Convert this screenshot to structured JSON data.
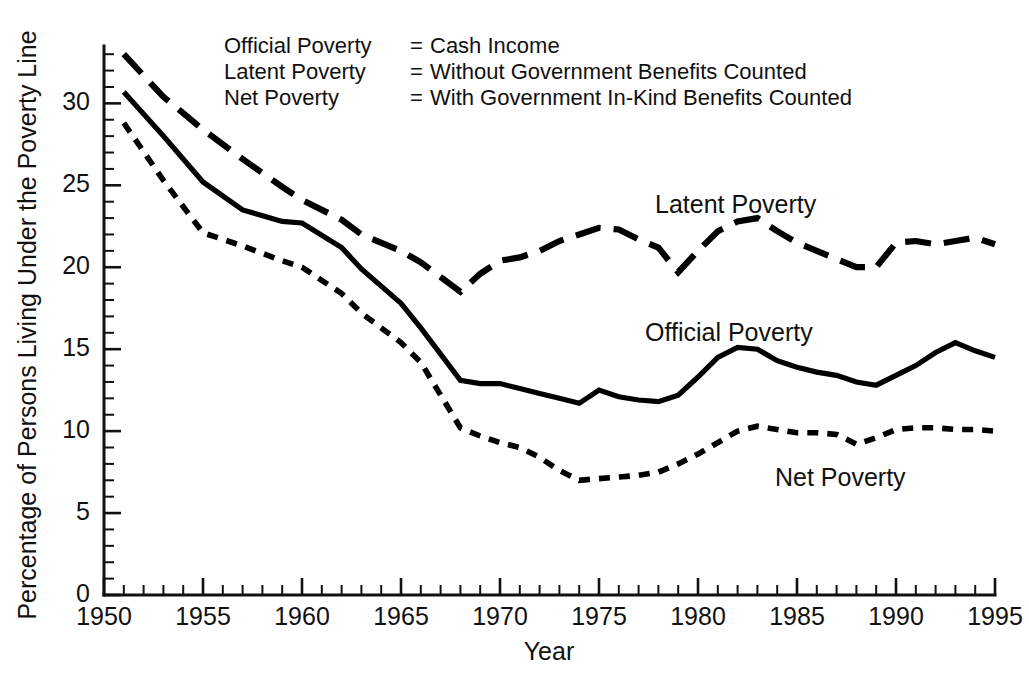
{
  "figure": {
    "background_color": "#ffffff",
    "ink_color": "#000000"
  },
  "legend_block": {
    "rows": [
      {
        "name": "Official Poverty",
        "equals": "=",
        "definition": "Cash Income"
      },
      {
        "name": "Latent Poverty",
        "equals": "=",
        "definition": "Without Government Benefits Counted"
      },
      {
        "name": "Net Poverty",
        "equals": "=",
        "definition": "With Government In-Kind Benefits Counted"
      }
    ]
  },
  "series_labels": [
    {
      "text": "Latent Poverty"
    },
    {
      "text": "Official Poverty"
    },
    {
      "text": "Net Poverty"
    }
  ],
  "axes": {
    "x": {
      "title": "Year",
      "ticks": [
        "1950",
        "1955",
        "1960",
        "1965",
        "1970",
        "1975",
        "1980",
        "1985",
        "1990",
        "1995"
      ],
      "minor_tick_step": 1,
      "range": [
        1950,
        1995
      ]
    },
    "y": {
      "title": "Percentage of Persons Living Under the Poverty Line",
      "ticks": [
        "0",
        "5",
        "10",
        "15",
        "20",
        "25",
        "30"
      ],
      "minor_tick_step": 1,
      "range": [
        0,
        33.5
      ]
    }
  },
  "chart_data": {
    "type": "line",
    "title": "",
    "subtitle": "",
    "xlabel": "Year",
    "ylabel": "Percentage of Persons Living Under the Poverty Line",
    "xlim": [
      1950,
      1995
    ],
    "ylim": [
      0,
      33.5
    ],
    "grid": false,
    "legend_position": "inline-annotations",
    "x": [
      1951,
      1953,
      1955,
      1957,
      1959,
      1960,
      1962,
      1963,
      1965,
      1966,
      1968,
      1969,
      1970,
      1971,
      1972,
      1973,
      1974,
      1975,
      1976,
      1977,
      1978,
      1979,
      1980,
      1981,
      1982,
      1983,
      1984,
      1985,
      1986,
      1987,
      1988,
      1989,
      1990,
      1991,
      1992,
      1993,
      1994,
      1995
    ],
    "series": [
      {
        "name": "Latent Poverty",
        "style": "long-dash",
        "annotation": "Latent Poverty",
        "values": [
          33.0,
          30.4,
          28.4,
          26.6,
          24.9,
          24.1,
          22.9,
          22.0,
          21.0,
          20.3,
          18.5,
          19.6,
          20.4,
          20.6,
          21.0,
          21.6,
          22.0,
          22.4,
          22.3,
          21.7,
          21.2,
          19.7,
          21.0,
          22.2,
          22.8,
          23.0,
          22.2,
          21.5,
          21.0,
          20.5,
          20.0,
          20.0,
          21.5,
          21.6,
          21.4,
          21.6,
          21.8,
          21.4
        ]
      },
      {
        "name": "Official Poverty",
        "style": "solid",
        "annotation": "Official Poverty",
        "values": [
          30.7,
          28.0,
          25.2,
          23.5,
          22.8,
          22.7,
          21.2,
          19.9,
          17.8,
          16.3,
          13.1,
          12.9,
          12.9,
          12.6,
          12.3,
          12.0,
          11.7,
          12.5,
          12.1,
          11.9,
          11.8,
          12.2,
          13.3,
          14.5,
          15.1,
          15.0,
          14.3,
          13.9,
          13.6,
          13.4,
          13.0,
          12.8,
          13.4,
          14.0,
          14.8,
          15.4,
          14.9,
          14.5
        ]
      },
      {
        "name": "Net Poverty",
        "style": "short-dash",
        "annotation": "Net Poverty",
        "values": [
          28.8,
          25.3,
          22.1,
          21.3,
          20.4,
          20.0,
          18.4,
          17.2,
          15.4,
          14.2,
          10.2,
          9.7,
          9.3,
          9.0,
          8.4,
          7.6,
          7.0,
          7.1,
          7.2,
          7.3,
          7.5,
          8.0,
          8.6,
          9.3,
          10.0,
          10.3,
          10.1,
          9.9,
          9.9,
          9.8,
          9.2,
          9.6,
          10.1,
          10.2,
          10.2,
          10.1,
          10.1,
          10.0
        ]
      }
    ]
  }
}
